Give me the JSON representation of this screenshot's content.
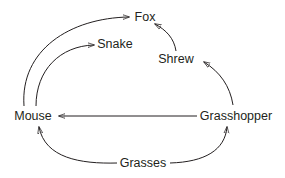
{
  "diagram": {
    "type": "food-web",
    "colors": {
      "ink": "#231f20",
      "background": "#ffffff"
    },
    "nodes": {
      "fox": {
        "label": "Fox",
        "x": 141,
        "y": 17
      },
      "snake": {
        "label": "Snake",
        "x": 114,
        "y": 44
      },
      "shrew": {
        "label": "Shrew",
        "x": 176,
        "y": 59
      },
      "mouse": {
        "label": "Mouse",
        "x": 33,
        "y": 116
      },
      "grasshopper": {
        "label": "Grasshopper",
        "x": 236,
        "y": 116
      },
      "grasses": {
        "label": "Grasses",
        "x": 143,
        "y": 163
      }
    },
    "edges": [
      {
        "from": "Mouse",
        "to": "Fox"
      },
      {
        "from": "Mouse",
        "to": "Snake"
      },
      {
        "from": "Shrew",
        "to": "Fox"
      },
      {
        "from": "Grasshopper",
        "to": "Shrew"
      },
      {
        "from": "Grasshopper",
        "to": "Mouse"
      },
      {
        "from": "Grasses",
        "to": "Mouse"
      },
      {
        "from": "Grasses",
        "to": "Grasshopper"
      }
    ]
  }
}
